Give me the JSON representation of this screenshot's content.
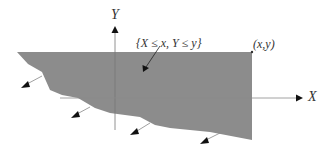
{
  "diagram": {
    "labels": {
      "y_axis": "Y",
      "x_axis": "X",
      "region": "{X ≤ x, Y ≤ y}",
      "point": "(x,y)"
    },
    "colors": {
      "region_fill": "#8c8c8c",
      "axis": "#9a9a9a",
      "arrow": "#111111",
      "text": "#333333",
      "background": "#ffffff"
    }
  }
}
